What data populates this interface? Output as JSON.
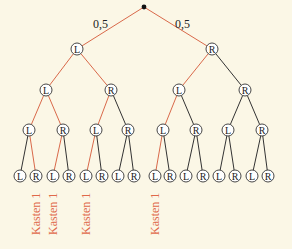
{
  "diagram": {
    "type": "probability-tree",
    "colors": {
      "background": "#fbf7e6",
      "highlight_edge": "#d9694a",
      "normal_edge": "#333333",
      "label_red": "#e0694a"
    },
    "root": {
      "x": 144,
      "y": 7
    },
    "probabilities": [
      {
        "text": "0,5",
        "x": 93,
        "y": 28
      },
      {
        "text": "0,5",
        "x": 175,
        "y": 28
      }
    ],
    "levels": [
      {
        "y": 49,
        "nodes": [
          {
            "label": "L",
            "x": 77,
            "parent_x": 144,
            "parent_y": 7,
            "red": true
          },
          {
            "label": "R",
            "x": 212,
            "parent_x": 144,
            "parent_y": 7,
            "red": true
          }
        ]
      },
      {
        "y": 90,
        "nodes": [
          {
            "label": "L",
            "x": 46,
            "parent_x": 77,
            "parent_y": 49,
            "red": true
          },
          {
            "label": "R",
            "x": 111,
            "parent_x": 77,
            "parent_y": 49,
            "red": true
          },
          {
            "label": "L",
            "x": 179,
            "parent_x": 212,
            "parent_y": 49,
            "red": true
          },
          {
            "label": "R",
            "x": 245,
            "parent_x": 212,
            "parent_y": 49,
            "red": false
          }
        ]
      },
      {
        "y": 130,
        "nodes": [
          {
            "label": "L",
            "x": 29,
            "parent_x": 46,
            "parent_y": 90,
            "red": true
          },
          {
            "label": "R",
            "x": 63,
            "parent_x": 46,
            "parent_y": 90,
            "red": true
          },
          {
            "label": "L",
            "x": 96,
            "parent_x": 111,
            "parent_y": 90,
            "red": true
          },
          {
            "label": "R",
            "x": 128,
            "parent_x": 111,
            "parent_y": 90,
            "red": false
          },
          {
            "label": "L",
            "x": 163,
            "parent_x": 179,
            "parent_y": 90,
            "red": true
          },
          {
            "label": "R",
            "x": 196,
            "parent_x": 179,
            "parent_y": 90,
            "red": false
          },
          {
            "label": "L",
            "x": 228,
            "parent_x": 245,
            "parent_y": 90,
            "red": false
          },
          {
            "label": "R",
            "x": 262,
            "parent_x": 245,
            "parent_y": 90,
            "red": false
          }
        ]
      },
      {
        "y": 176,
        "nodes": [
          {
            "label": "L",
            "x": 20,
            "parent_x": 29,
            "parent_y": 130,
            "red": false
          },
          {
            "label": "R",
            "x": 36,
            "parent_x": 29,
            "parent_y": 130,
            "red": true
          },
          {
            "label": "L",
            "x": 53,
            "parent_x": 63,
            "parent_y": 130,
            "red": true
          },
          {
            "label": "R",
            "x": 69,
            "parent_x": 63,
            "parent_y": 130,
            "red": false
          },
          {
            "label": "L",
            "x": 86,
            "parent_x": 96,
            "parent_y": 130,
            "red": true
          },
          {
            "label": "R",
            "x": 102,
            "parent_x": 96,
            "parent_y": 130,
            "red": false
          },
          {
            "label": "L",
            "x": 118,
            "parent_x": 128,
            "parent_y": 130,
            "red": false
          },
          {
            "label": "R",
            "x": 134,
            "parent_x": 128,
            "parent_y": 130,
            "red": false
          },
          {
            "label": "L",
            "x": 155,
            "parent_x": 163,
            "parent_y": 130,
            "red": true
          },
          {
            "label": "R",
            "x": 170,
            "parent_x": 163,
            "parent_y": 130,
            "red": false
          },
          {
            "label": "L",
            "x": 186,
            "parent_x": 196,
            "parent_y": 130,
            "red": false
          },
          {
            "label": "R",
            "x": 203,
            "parent_x": 196,
            "parent_y": 130,
            "red": false
          },
          {
            "label": "L",
            "x": 219,
            "parent_x": 228,
            "parent_y": 130,
            "red": false
          },
          {
            "label": "R",
            "x": 235,
            "parent_x": 228,
            "parent_y": 130,
            "red": false
          },
          {
            "label": "L",
            "x": 252,
            "parent_x": 262,
            "parent_y": 130,
            "red": false
          },
          {
            "label": "R",
            "x": 268,
            "parent_x": 262,
            "parent_y": 130,
            "red": false
          }
        ]
      }
    ],
    "leaf_labels": [
      {
        "text": "Kasten 1",
        "x": 36
      },
      {
        "text": "Kasten 1",
        "x": 53
      },
      {
        "text": "Kasten 1",
        "x": 86
      },
      {
        "text": "Kasten 1",
        "x": 155
      }
    ]
  }
}
